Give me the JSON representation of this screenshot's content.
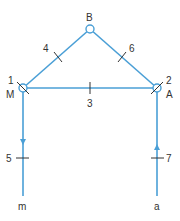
{
  "colors": {
    "line": "#4a9fd6",
    "tick": "#333333",
    "text": "#333333"
  },
  "nodes": {
    "B": {
      "label": "B"
    },
    "M": {
      "label": "M",
      "number": "1"
    },
    "A": {
      "label": "A",
      "number": "2"
    }
  },
  "edges": {
    "e3": {
      "label": "3"
    },
    "e4": {
      "label": "4"
    },
    "e5": {
      "label": "5"
    },
    "e6": {
      "label": "6"
    },
    "e7": {
      "label": "7"
    }
  },
  "terminals": {
    "m": {
      "label": "m"
    },
    "a": {
      "label": "a"
    }
  }
}
